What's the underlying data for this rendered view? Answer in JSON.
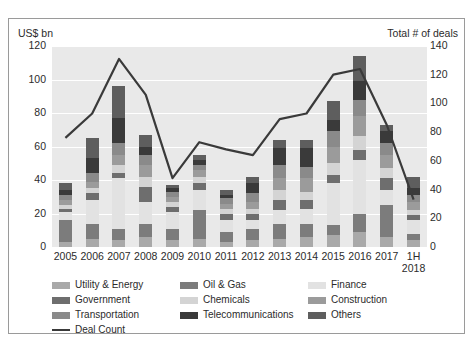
{
  "axis": {
    "left_caption": "US$ bn",
    "right_caption": "Total # of deals",
    "left_ticks": [
      "120",
      "100",
      "80",
      "60",
      "40",
      "20",
      "0"
    ],
    "right_ticks": [
      "140",
      "120",
      "100",
      "80",
      "60",
      "40",
      "20",
      "0"
    ]
  },
  "legend": [
    {
      "label": "Utility & Energy",
      "color": "#a9a9a9",
      "type": "swatch"
    },
    {
      "label": "Oil & Gas",
      "color": "#7c7c7c",
      "type": "swatch"
    },
    {
      "label": "Finance",
      "color": "#e2e2e2",
      "type": "swatch"
    },
    {
      "label": "Government",
      "color": "#6e6e6e",
      "type": "swatch"
    },
    {
      "label": "Chemicals",
      "color": "#d4d4d4",
      "type": "swatch"
    },
    {
      "label": "Construction",
      "color": "#9b9b9b",
      "type": "swatch"
    },
    {
      "label": "Transportation",
      "color": "#8a8a8a",
      "type": "swatch"
    },
    {
      "label": "Telecommunications",
      "color": "#3a3a3a",
      "type": "swatch"
    },
    {
      "label": "Others",
      "color": "#5e5e5e",
      "type": "swatch"
    },
    {
      "label": "Deal Count",
      "color": "#3a3a3a",
      "type": "line"
    }
  ],
  "chart_data": {
    "type": "bar",
    "title": "",
    "subtype": "stacked-bar-with-line-overlay",
    "categories": [
      "2005",
      "2006",
      "2007",
      "2008",
      "2009",
      "2010",
      "2011",
      "2012",
      "2013",
      "2014",
      "2015",
      "2016",
      "2017",
      "1H 2018"
    ],
    "category_lines": [
      [
        "2005"
      ],
      [
        "2006"
      ],
      [
        "2007"
      ],
      [
        "2008"
      ],
      [
        "2009"
      ],
      [
        "2010"
      ],
      [
        "2011"
      ],
      [
        "2012"
      ],
      [
        "2013"
      ],
      [
        "2014"
      ],
      [
        "2015"
      ],
      [
        "2016"
      ],
      [
        "2017"
      ],
      [
        "1H",
        "2018"
      ]
    ],
    "xlabel": "",
    "ylabel": "US$ bn",
    "ylim": [
      0,
      120
    ],
    "y2label": "Total # of deals",
    "y2lim": [
      0,
      140
    ],
    "grid": true,
    "legend_position": "bottom",
    "series": [
      {
        "name": "Utility & Energy",
        "color": "#a9a9a9",
        "values": [
          3,
          5,
          4,
          6,
          4,
          5,
          3,
          4,
          5,
          6,
          7,
          9,
          6,
          4
        ]
      },
      {
        "name": "Oil & Gas",
        "color": "#7c7c7c",
        "values": [
          13,
          9,
          7,
          8,
          7,
          17,
          6,
          7,
          9,
          8,
          6,
          11,
          19,
          4
        ]
      },
      {
        "name": "Finance",
        "color": "#e2e2e2",
        "values": [
          5,
          14,
          30,
          13,
          10,
          12,
          7,
          5,
          8,
          9,
          25,
          32,
          9,
          8
        ]
      },
      {
        "name": "Government",
        "color": "#6e6e6e",
        "values": [
          2,
          4,
          3,
          9,
          3,
          4,
          4,
          4,
          6,
          5,
          5,
          6,
          7,
          3
        ]
      },
      {
        "name": "Chemicals",
        "color": "#d4d4d4",
        "values": [
          2,
          3,
          5,
          6,
          3,
          4,
          3,
          3,
          6,
          5,
          7,
          8,
          6,
          3
        ]
      },
      {
        "name": "Construction",
        "color": "#9b9b9b",
        "values": [
          3,
          4,
          6,
          7,
          3,
          4,
          3,
          4,
          7,
          8,
          10,
          12,
          8,
          5
        ]
      },
      {
        "name": "Transportation",
        "color": "#8a8a8a",
        "values": [
          3,
          5,
          7,
          6,
          3,
          3,
          3,
          5,
          8,
          7,
          9,
          10,
          7,
          4
        ]
      },
      {
        "name": "Telecommunications",
        "color": "#3a3a3a",
        "values": [
          3,
          9,
          15,
          5,
          2,
          3,
          2,
          6,
          10,
          11,
          7,
          11,
          7,
          4
        ]
      },
      {
        "name": "Others",
        "color": "#5e5e5e",
        "values": [
          4,
          12,
          19,
          7,
          2,
          3,
          3,
          4,
          5,
          5,
          11,
          15,
          4,
          7
        ]
      }
    ],
    "bar_totals": [
      38,
      65,
      96,
      67,
      37,
      55,
      34,
      42,
      64,
      64,
      87,
      114,
      73,
      42
    ],
    "line_series": {
      "name": "Deal Count",
      "color": "#3a3a3a",
      "values": [
        76,
        93,
        131,
        106,
        48,
        73,
        68,
        64,
        89,
        93,
        120,
        124,
        85,
        33
      ]
    }
  }
}
